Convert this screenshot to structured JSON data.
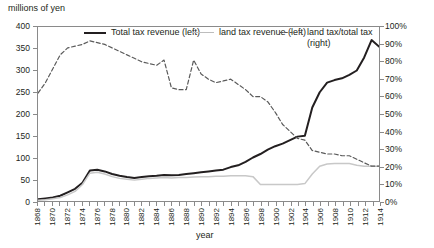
{
  "chart_data": {
    "type": "line",
    "title": "",
    "ylabel": "millions of yen",
    "ylabel_right": "",
    "xlabel": "year",
    "ylim": [
      0,
      400
    ],
    "ylim_right": [
      0,
      100
    ],
    "xlim": [
      1868,
      1914
    ],
    "grid": false,
    "legend_position": "top-inside",
    "yticks": [
      "0",
      "50",
      "100",
      "150",
      "200",
      "250",
      "300",
      "350",
      "400"
    ],
    "yticks_right": [
      "0%",
      "10%",
      "20%",
      "30%",
      "40%",
      "50%",
      "60%",
      "70%",
      "80%",
      "90%",
      "100%"
    ],
    "xticks": [
      "1868",
      "1870",
      "1872",
      "1874",
      "1876",
      "1878",
      "1880",
      "1882",
      "1884",
      "1886",
      "1888",
      "1890",
      "1892",
      "1894",
      "1896",
      "1898",
      "1900",
      "1902",
      "1904",
      "1906",
      "1908",
      "1910",
      "1912",
      "1914"
    ],
    "x": [
      1868,
      1869,
      1870,
      1871,
      1872,
      1873,
      1874,
      1875,
      1876,
      1877,
      1878,
      1879,
      1880,
      1881,
      1882,
      1883,
      1884,
      1885,
      1886,
      1887,
      1888,
      1889,
      1890,
      1891,
      1892,
      1893,
      1894,
      1895,
      1896,
      1897,
      1898,
      1899,
      1900,
      1901,
      1902,
      1903,
      1904,
      1905,
      1906,
      1907,
      1908,
      1909,
      1910,
      1911,
      1912,
      1913,
      1914
    ],
    "series": [
      {
        "name": "Total tax revenue (left)",
        "axis": "left",
        "color": "#231f20",
        "style": "solid",
        "values": [
          4,
          6,
          8,
          12,
          20,
          28,
          42,
          70,
          72,
          68,
          62,
          58,
          55,
          53,
          55,
          57,
          58,
          60,
          59,
          60,
          62,
          64,
          66,
          68,
          70,
          72,
          78,
          82,
          90,
          100,
          108,
          118,
          126,
          132,
          140,
          148,
          150,
          215,
          250,
          272,
          278,
          282,
          290,
          300,
          330,
          370,
          355
        ]
      },
      {
        "name": "land tax revenue (left)",
        "axis": "left",
        "color": "#c8c8c8",
        "style": "solid",
        "values": [
          2,
          3,
          5,
          8,
          14,
          22,
          38,
          64,
          66,
          62,
          56,
          52,
          50,
          48,
          50,
          52,
          53,
          54,
          53,
          54,
          54,
          55,
          56,
          56,
          57,
          57,
          58,
          58,
          58,
          56,
          38,
          38,
          38,
          38,
          38,
          38,
          40,
          62,
          80,
          85,
          86,
          86,
          86,
          82,
          80,
          80,
          80
        ]
      },
      {
        "name": "land tax/total tax (right)",
        "axis": "right",
        "color": "#5a5a5a",
        "style": "dashed",
        "values": [
          62,
          68,
          76,
          84,
          88,
          89,
          90,
          92,
          91,
          90,
          88,
          86,
          84,
          82,
          80,
          79,
          78,
          81,
          65,
          64,
          64,
          81,
          73,
          70,
          68,
          69,
          70,
          67,
          64,
          60,
          60,
          57,
          51,
          44,
          40,
          36,
          35,
          29,
          28,
          27,
          27,
          26,
          26,
          24,
          22,
          20,
          20
        ]
      }
    ]
  }
}
